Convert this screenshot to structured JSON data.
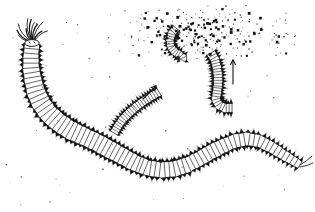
{
  "figure": {
    "kind": "scientific-line-drawing",
    "background_color": "#ffffff",
    "ink_color": "#111111",
    "width": 315,
    "height": 212,
    "caption_text": "",
    "labels": []
  },
  "main_worm": {
    "name": "adult-polychaete-worm",
    "description": "large segmented annelid worm with tentacled head at upper left, sinuous body sweeping down and to the right",
    "segment_count": 74,
    "head_appendage_count": 11,
    "tail_cirri_count": 2,
    "path": [
      [
        32,
        44
      ],
      [
        31,
        56
      ],
      [
        31,
        68
      ],
      [
        33,
        80
      ],
      [
        36,
        92
      ],
      [
        41,
        103
      ],
      [
        48,
        113
      ],
      [
        58,
        122
      ],
      [
        70,
        130
      ],
      [
        83,
        136
      ],
      [
        96,
        142
      ],
      [
        109,
        149
      ],
      [
        122,
        156
      ],
      [
        135,
        163
      ],
      [
        148,
        168
      ],
      [
        161,
        170
      ],
      [
        174,
        169
      ],
      [
        187,
        165
      ],
      [
        199,
        159
      ],
      [
        211,
        152
      ],
      [
        223,
        146
      ],
      [
        235,
        141
      ],
      [
        247,
        139
      ],
      [
        259,
        141
      ],
      [
        271,
        147
      ],
      [
        282,
        154
      ],
      [
        292,
        160
      ],
      [
        300,
        165
      ]
    ],
    "half_width": [
      7.5,
      8,
      8.5,
      9,
      9.5,
      9.5,
      9.5,
      9.5,
      9.5,
      9,
      9,
      9,
      8.5,
      8.5,
      8,
      8,
      8,
      8,
      7.5,
      7.5,
      7.5,
      7,
      7,
      6.5,
      6,
      5.5,
      5,
      4
    ]
  },
  "epitoke_diagonal": {
    "name": "swimming-epitoke-lower",
    "description": "small segmented worm swimming diagonally up-right",
    "segment_count": 22,
    "path": [
      [
        114,
        133
      ],
      [
        118,
        126
      ],
      [
        123,
        119
      ],
      [
        129,
        113
      ],
      [
        136,
        107
      ],
      [
        144,
        101
      ],
      [
        152,
        96
      ],
      [
        159,
        92
      ]
    ],
    "half_width": 4.2
  },
  "epitoke_vertical": {
    "name": "swimming-epitoke-right",
    "description": "small segmented worm swimming upward, body hooked at lower end",
    "segment_count": 24,
    "path": [
      [
        211,
        53
      ],
      [
        215,
        60
      ],
      [
        217,
        68
      ],
      [
        218,
        76
      ],
      [
        218,
        84
      ],
      [
        217,
        92
      ],
      [
        216,
        99
      ],
      [
        219,
        105
      ],
      [
        225,
        108
      ],
      [
        232,
        108
      ]
    ],
    "half_width": 4.6
  },
  "epitoke_spawning": {
    "name": "spawning-epitoke",
    "description": "coiled worm at centre of gamete cloud, releasing gametes",
    "segment_count": 16,
    "path": [
      [
        176,
        28
      ],
      [
        172,
        33
      ],
      [
        170,
        40
      ],
      [
        171,
        47
      ],
      [
        175,
        52
      ],
      [
        180,
        55
      ],
      [
        183,
        58
      ],
      [
        182,
        60
      ]
    ],
    "half_width": 4.0
  },
  "arrows": [
    {
      "name": "arrow-up-right",
      "direction": "up-right",
      "angle_degrees": 45,
      "from": [
        143,
        99
      ],
      "to": [
        156,
        86
      ]
    },
    {
      "name": "arrow-up",
      "direction": "up",
      "angle_degrees": 90,
      "from": [
        233,
        84
      ],
      "to": [
        233,
        60
      ]
    }
  ],
  "gamete_cloud": {
    "name": "gamete-cloud",
    "description": "dense cloud of dark dots representing released eggs and sperm",
    "center": [
      205,
      33
    ],
    "extent": {
      "x_min": 108,
      "x_max": 300,
      "y_min": 5,
      "y_max": 62
    },
    "dense_dot_count": 290,
    "sparse_dot_count": 58,
    "sparse_region": {
      "x_min": 5,
      "x_max": 312,
      "y_min": 10,
      "y_max": 205
    }
  }
}
